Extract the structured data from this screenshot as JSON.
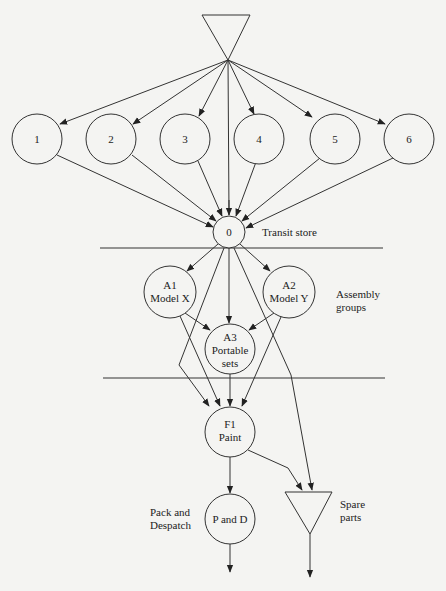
{
  "diagram": {
    "type": "process-flow",
    "colors": {
      "stroke": "#333333",
      "background": "#f4f4f2",
      "text": "#222222"
    },
    "source_triangle": {
      "points": [
        [
          202,
          15
        ],
        [
          250,
          15
        ],
        [
          228,
          60
        ]
      ]
    },
    "suppliers": [
      {
        "id": "1",
        "label": "1",
        "cx": 37,
        "cy": 139
      },
      {
        "id": "2",
        "label": "2",
        "cx": 111,
        "cy": 139
      },
      {
        "id": "3",
        "label": "3",
        "cx": 185,
        "cy": 139
      },
      {
        "id": "4",
        "label": "4",
        "cx": 259,
        "cy": 139
      },
      {
        "id": "5",
        "label": "5",
        "cx": 335,
        "cy": 139
      },
      {
        "id": "6",
        "label": "6",
        "cx": 409,
        "cy": 139
      }
    ],
    "transit": {
      "label": "0",
      "side_label": "Transit store"
    },
    "assembly": {
      "a1": {
        "line1": "A1",
        "line2": "Model X"
      },
      "a2": {
        "line1": "A2",
        "line2": "Model Y"
      },
      "a3": {
        "line1": "A3",
        "line2": "Portable",
        "line3": "sets"
      },
      "side_label_1": "Assembly",
      "side_label_2": "groups"
    },
    "paint": {
      "line1": "F1",
      "line2": "Paint"
    },
    "pack": {
      "label": "P and D",
      "side_label_1": "Pack and",
      "side_label_2": "Despatch"
    },
    "spare": {
      "side_label_1": "Spare",
      "side_label_2": "parts"
    }
  }
}
